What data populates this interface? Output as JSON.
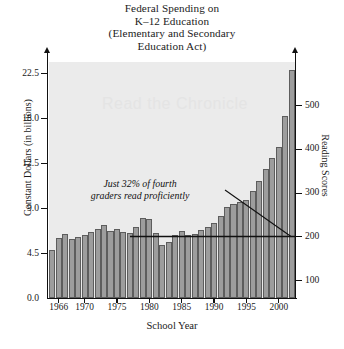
{
  "chart_data": {
    "type": "bar",
    "title": "Federal Spending on K–12 Education (Elementary and Secondary Education Act)",
    "title_lines": [
      "Federal Spending on",
      "K–12 Education",
      "(Elementary and Secondary",
      "Education Act)"
    ],
    "xlabel": "School Year",
    "ylabel": "Constant Dollars (in billions)",
    "ylabel_right": "Reading Scores",
    "x_tick_labels": [
      "1966",
      "1970",
      "1975",
      "1980",
      "1985",
      "1990",
      "1995",
      "2000"
    ],
    "x_tick_years": [
      1966,
      1970,
      1975,
      1980,
      1985,
      1990,
      1995,
      2000
    ],
    "y_tick_labels": [
      "0.0",
      "4.5",
      "9.0",
      "12.5",
      "18.0",
      "22.5"
    ],
    "y_tick_values": [
      0.0,
      4.5,
      9.0,
      12.5,
      18.0,
      22.5
    ],
    "y_right_tick_labels": [
      "100",
      "200",
      "300",
      "400",
      "500"
    ],
    "y_right_tick_values": [
      100,
      200,
      300,
      400,
      500
    ],
    "ylim": [
      0.0,
      23.5
    ],
    "ylim_right": [
      0,
      560
    ],
    "grid": false,
    "legend": false,
    "bar_color": "#9d9d9d",
    "bar_edge_color": "#5d5d5d",
    "plot_background": "#ebebeb",
    "categories": [
      1965,
      1966,
      1967,
      1968,
      1969,
      1970,
      1971,
      1972,
      1973,
      1974,
      1975,
      1976,
      1977,
      1978,
      1979,
      1980,
      1981,
      1982,
      1983,
      1984,
      1985,
      1986,
      1987,
      1988,
      1989,
      1990,
      1991,
      1992,
      1993,
      1994,
      1995,
      1996,
      1997,
      1998,
      1999,
      2000,
      2001,
      2002
    ],
    "values": [
      4.8,
      6.0,
      6.4,
      5.9,
      6.1,
      6.3,
      6.6,
      6.9,
      7.3,
      6.7,
      6.9,
      6.6,
      6.5,
      7.1,
      8.0,
      7.9,
      6.5,
      5.3,
      5.6,
      6.3,
      6.7,
      6.3,
      6.4,
      6.8,
      7.1,
      7.5,
      8.2,
      9.1,
      9.3,
      9.5,
      9.6,
      10.3,
      11.1,
      12.0,
      13.1,
      14.4,
      18.2,
      22.8
    ],
    "reading_score_line": {
      "label": "flat reading score trend",
      "value": 200,
      "start_year": 1979,
      "end_year": 2002
    },
    "annotation": {
      "lines": [
        "Just 32% of fourth",
        "graders read proficiently"
      ],
      "text": "Just 32% of fourth graders read proficiently",
      "percent": "32%"
    },
    "watermark": "Read the Chronicle"
  }
}
